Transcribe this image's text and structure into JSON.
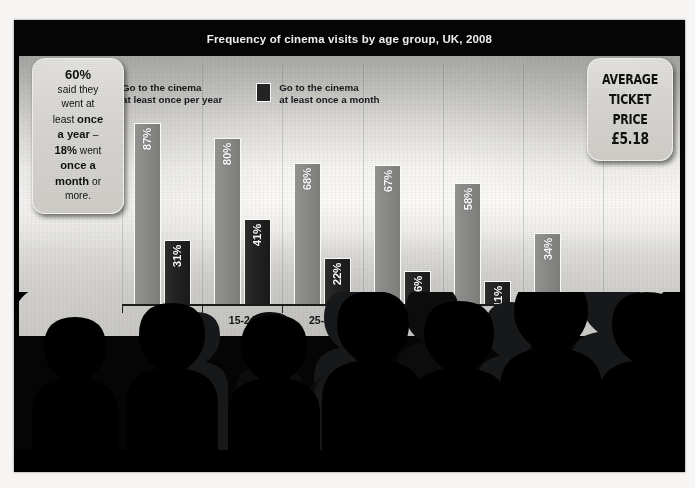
{
  "chart_data": {
    "type": "bar",
    "title": "Frequency of cinema visits by age group, UK, 2008",
    "xlabel": "",
    "ylabel": "",
    "ylim": [
      0,
      100
    ],
    "grid": false,
    "legend_position": "top",
    "categories": [
      "7-14",
      "15-24",
      "25-34",
      "35-44",
      "45-54",
      "55+"
    ],
    "series": [
      {
        "name": "Go to the cinema at least once per year",
        "color": "#8a8a88",
        "values": [
          87,
          80,
          68,
          67,
          58,
          34
        ],
        "labels": [
          "87%",
          "80%",
          "68%",
          "67%",
          "58%",
          "34%"
        ]
      },
      {
        "name": "Go to the cinema at least once a month",
        "color": "#222222",
        "values": [
          31,
          41,
          22,
          16,
          11,
          6
        ],
        "labels": [
          "31%",
          "41%",
          "22%",
          "16%",
          "11%",
          "6%"
        ]
      }
    ]
  },
  "legend": {
    "items": [
      {
        "line1": "Go to the cinema",
        "line2": "at least once per year",
        "swatch": "light"
      },
      {
        "line1": "Go to the cinema",
        "line2": "at least once a month",
        "swatch": "dark"
      }
    ]
  },
  "callout_left": {
    "seg1": "60%",
    "seg2": "said they",
    "seg3": "went at",
    "seg4_plain": "least ",
    "seg4_bold": "once",
    "seg5_bold": "a year",
    "seg5_plain": " –",
    "seg6_bold": "18%",
    "seg6_plain": " went",
    "seg7_bold": "once a",
    "seg8_bold": "month",
    "seg8_plain": " or",
    "seg9": "more."
  },
  "callout_right": {
    "line1": "AVERAGE",
    "line2": "TICKET",
    "line3": "PRICE",
    "price": "£5.18"
  },
  "colors": {
    "bar_light": "#8a8a88",
    "bar_dark": "#222222",
    "frame": "#050505",
    "screen_bright": "#fcfbf9",
    "callout_bg": "#d7d6d2"
  }
}
